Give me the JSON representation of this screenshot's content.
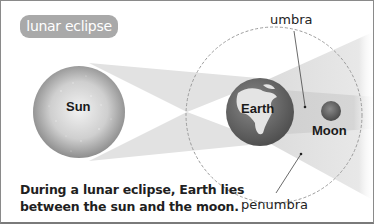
{
  "diagram": {
    "title": "lunar eclipse",
    "bodies": {
      "sun": "Sun",
      "earth": "Earth",
      "moon": "Moon"
    },
    "regions": {
      "umbra": "umbra",
      "penumbra": "penumbra"
    },
    "caption": {
      "line1": "During a lunar eclipse, Earth lies",
      "line2": "between the sun and the moon."
    },
    "colors": {
      "title_pill": "#a9a9a9",
      "sun": "#bdbdbd",
      "earth": "#6e6e6e",
      "moon": "#6a6a6a",
      "penumbra_cone": "#e3e3e3",
      "umbra_cone": "#d0d0d0",
      "orbit": "#9a9a9a"
    }
  }
}
